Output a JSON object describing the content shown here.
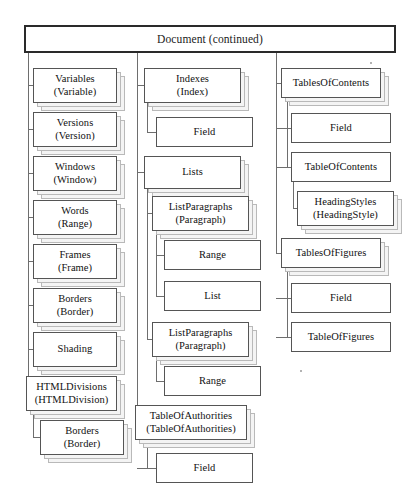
{
  "diagram": {
    "title": "Document (continued)",
    "header": {
      "label": "Document (continued)",
      "x": 24,
      "y": 25,
      "w": 372,
      "h": 28
    },
    "columns": [
      {
        "name": "left-column",
        "trunk_x": 28,
        "trunk_top": 53,
        "trunk_bottom": 408,
        "nodes": [
          {
            "id": "variables",
            "label": "Variables",
            "sub": "(Variable)",
            "x": 33,
            "y": 68,
            "w": 84,
            "h": 35,
            "stacked": true,
            "connect_y": 85
          },
          {
            "id": "versions",
            "label": "Versions",
            "sub": "(Version)",
            "x": 33,
            "y": 112,
            "w": 84,
            "h": 35,
            "stacked": true,
            "connect_y": 129
          },
          {
            "id": "windows",
            "label": "Windows",
            "sub": "(Window)",
            "x": 33,
            "y": 156,
            "w": 84,
            "h": 35,
            "stacked": true,
            "connect_y": 173
          },
          {
            "id": "words",
            "label": "Words",
            "sub": "(Range)",
            "x": 33,
            "y": 200,
            "w": 84,
            "h": 35,
            "stacked": true,
            "connect_y": 217
          },
          {
            "id": "frames",
            "label": "Frames",
            "sub": "(Frame)",
            "x": 33,
            "y": 244,
            "w": 84,
            "h": 35,
            "stacked": true,
            "connect_y": 261
          },
          {
            "id": "borders-1",
            "label": "Borders",
            "sub": "(Border)",
            "x": 33,
            "y": 288,
            "w": 84,
            "h": 35,
            "stacked": true,
            "connect_y": 305
          },
          {
            "id": "shading",
            "label": "Shading",
            "sub": "",
            "x": 33,
            "y": 332,
            "w": 84,
            "h": 35,
            "stacked": true,
            "connect_y": 349
          },
          {
            "id": "htmldivisions",
            "label": "HTMLDivisions",
            "sub": "(HTMLDivision)",
            "x": 26,
            "y": 376,
            "w": 91,
            "h": 35,
            "stacked": true,
            "connect_y": 393
          },
          {
            "id": "borders-2",
            "label": "Borders",
            "sub": "(Border)",
            "x": 40,
            "y": 420,
            "w": 84,
            "h": 35,
            "stacked": true,
            "connect_y": 437,
            "parent": "htmldivisions"
          }
        ],
        "subtrunks": [
          {
            "id": "htmldivisions-children",
            "x": 33,
            "top": 411,
            "bottom": 437
          }
        ]
      },
      {
        "name": "middle-column",
        "trunk_x": 137,
        "trunk_top": 53,
        "trunk_bottom": 425,
        "nodes": [
          {
            "id": "indexes",
            "label": "Indexes",
            "sub": "(Index)",
            "x": 144,
            "y": 68,
            "w": 97,
            "h": 35,
            "stacked": true,
            "connect_y": 85
          },
          {
            "id": "field-idx",
            "label": "Field",
            "sub": "",
            "x": 156,
            "y": 117,
            "w": 97,
            "h": 30,
            "stacked": false,
            "connect_y": 132,
            "parent": "indexes"
          },
          {
            "id": "lists",
            "label": "Lists",
            "sub": "",
            "x": 144,
            "y": 156,
            "w": 97,
            "h": 33,
            "stacked": true,
            "connect_y": 172
          },
          {
            "id": "listparagraphs-1",
            "label": "ListParagraphs",
            "sub": "(Paragraph)",
            "x": 152,
            "y": 196,
            "w": 97,
            "h": 35,
            "stacked": true,
            "connect_y": 213,
            "parent": "lists"
          },
          {
            "id": "range-1",
            "label": "Range",
            "sub": "",
            "x": 164,
            "y": 240,
            "w": 97,
            "h": 30,
            "stacked": false,
            "connect_y": 255,
            "parent": "listparagraphs-1"
          },
          {
            "id": "list",
            "label": "List",
            "sub": "",
            "x": 164,
            "y": 281,
            "w": 97,
            "h": 30,
            "stacked": false,
            "connect_y": 296,
            "parent": "listparagraphs-1"
          },
          {
            "id": "listparagraphs-2",
            "label": "ListParagraphs",
            "sub": "(Paragraph)",
            "x": 152,
            "y": 322,
            "w": 97,
            "h": 35,
            "stacked": true,
            "connect_y": 339,
            "parent": "lists"
          },
          {
            "id": "range-2",
            "label": "Range",
            "sub": "",
            "x": 164,
            "y": 366,
            "w": 97,
            "h": 30,
            "stacked": false,
            "connect_y": 381,
            "parent": "listparagraphs-2"
          },
          {
            "id": "tableofauthorities",
            "label": "TableOfAuthorities",
            "sub": "(TableOfAuthorities)",
            "x": 135,
            "y": 405,
            "w": 112,
            "h": 35,
            "stacked": true,
            "connect_y": 422
          },
          {
            "id": "field-toa",
            "label": "Field",
            "sub": "",
            "x": 156,
            "y": 453,
            "w": 97,
            "h": 30,
            "stacked": false,
            "connect_y": 468,
            "parent": "tableofauthorities"
          }
        ],
        "subtrunks": [
          {
            "id": "indexes-children",
            "x": 147,
            "top": 103,
            "bottom": 132
          },
          {
            "id": "lists-children",
            "x": 147,
            "top": 189,
            "bottom": 339
          },
          {
            "id": "listparagraphs-1-children",
            "x": 156,
            "top": 231,
            "bottom": 296
          },
          {
            "id": "listparagraphs-2-children",
            "x": 156,
            "top": 357,
            "bottom": 381
          },
          {
            "id": "toa-children",
            "x": 147,
            "top": 440,
            "bottom": 468
          }
        ]
      },
      {
        "name": "right-column",
        "trunk_x": 276,
        "trunk_top": 53,
        "trunk_bottom": 253,
        "nodes": [
          {
            "id": "tablesofcontents",
            "label": "TablesOfContents",
            "sub": "",
            "x": 281,
            "y": 68,
            "w": 100,
            "h": 30,
            "stacked": true,
            "connect_y": 83
          },
          {
            "id": "field-toc",
            "label": "Field",
            "sub": "",
            "x": 291,
            "y": 113,
            "w": 100,
            "h": 30,
            "stacked": false,
            "connect_y": 128,
            "parent": "tablesofcontents"
          },
          {
            "id": "tableofcontents",
            "label": "TableOfContents",
            "sub": "",
            "x": 291,
            "y": 152,
            "w": 100,
            "h": 30,
            "stacked": false,
            "connect_y": 167,
            "parent": "tablesofcontents"
          },
          {
            "id": "headingstyles",
            "label": "HeadingStyles",
            "sub": "(HeadingStyle)",
            "x": 297,
            "y": 191,
            "w": 97,
            "h": 35,
            "stacked": true,
            "connect_y": 208,
            "parent": "tableofcontents"
          },
          {
            "id": "tablesoffigures",
            "label": "TablesOfFigures",
            "sub": "",
            "x": 281,
            "y": 238,
            "w": 100,
            "h": 30,
            "stacked": true,
            "connect_y": 253
          },
          {
            "id": "field-tof",
            "label": "Field",
            "sub": "",
            "x": 291,
            "y": 283,
            "w": 100,
            "h": 30,
            "stacked": false,
            "connect_y": 298,
            "parent": "tablesoffigures"
          },
          {
            "id": "tableoffigures",
            "label": "TableOfFigures",
            "sub": "",
            "x": 291,
            "y": 322,
            "w": 100,
            "h": 30,
            "stacked": false,
            "connect_y": 337,
            "parent": "tablesoffigures"
          }
        ],
        "subtrunks": [
          {
            "id": "toc-children",
            "x": 287,
            "top": 98,
            "bottom": 167
          },
          {
            "id": "tableofcontents-children",
            "x": 293,
            "top": 182,
            "bottom": 208
          },
          {
            "id": "tof-children",
            "x": 287,
            "top": 268,
            "bottom": 337
          }
        ]
      }
    ]
  }
}
